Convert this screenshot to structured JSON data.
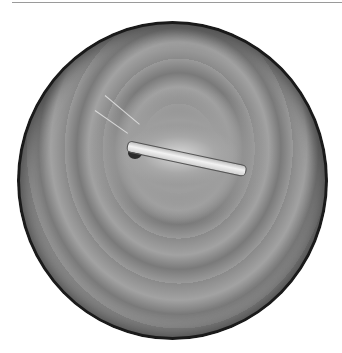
{
  "image": {
    "type": "endoscopic-view",
    "description": "Grayscale circular endoscopic image showing a white tubular instrument/stent crossing a fold of mucosa",
    "colors": {
      "background": "#ffffff",
      "frame": "#1a1a1a",
      "tissue": "#8e8e8e",
      "instrument": "#f2f2f2"
    }
  }
}
